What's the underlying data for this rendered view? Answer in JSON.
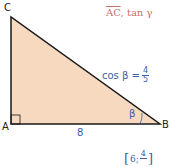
{
  "figure": {
    "vertices": {
      "A": "A",
      "B": "B",
      "C": "C"
    },
    "side_AB_label": "8",
    "angle_label": "β",
    "given": {
      "lhs": "cos β =",
      "numerator": "4",
      "denominator": "5"
    },
    "prompt": {
      "segment": "AC",
      "rest": ", tan γ"
    },
    "answer": {
      "open": "[",
      "first": "6;",
      "numerator": "4",
      "close": "]"
    },
    "colors": {
      "fill": "#f6d9bf",
      "stroke": "#1a1a1a",
      "label_blue": "#3a5ea8",
      "prompt_red": "#c9706a"
    }
  }
}
